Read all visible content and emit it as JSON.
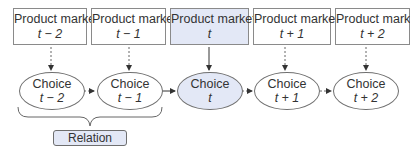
{
  "diagram": {
    "markets": [
      {
        "label": "Product market",
        "time": "t − 2",
        "highlighted": false
      },
      {
        "label": "Product market",
        "time": "t − 1",
        "highlighted": false
      },
      {
        "label": "Product market",
        "time": "t",
        "highlighted": true
      },
      {
        "label": "Product market",
        "time": "t + 1",
        "highlighted": false
      },
      {
        "label": "Product market",
        "time": "t + 2",
        "highlighted": false
      }
    ],
    "choices": [
      {
        "label": "Choice",
        "time": "t − 2",
        "highlighted": false
      },
      {
        "label": "Choice",
        "time": "t − 1",
        "highlighted": false
      },
      {
        "label": "Choice",
        "time": "t",
        "highlighted": true
      },
      {
        "label": "Choice",
        "time": "t + 1",
        "highlighted": false
      },
      {
        "label": "Choice",
        "time": "t + 2",
        "highlighted": false
      }
    ],
    "relation_label": "Relation",
    "colors": {
      "highlight_fill": "#e3e8f6",
      "border": "#8a8a8a",
      "text": "#333333"
    }
  }
}
